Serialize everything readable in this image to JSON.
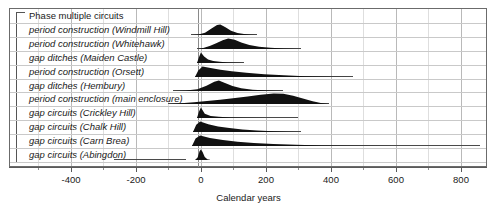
{
  "chart_data": {
    "type": "area",
    "title": "",
    "xlabel": "Calendar years",
    "ylabel": "",
    "xlim": [
      -520,
      900
    ],
    "grid": true,
    "legend_position": "none",
    "group_label": "Phase multiple circuits",
    "categories": [
      "period construction  (Windmill Hill)",
      "period construction  (Whitehawk)",
      "gap ditches  (Maiden Castle)",
      "period construction  (Orsett)",
      "gap ditches  (Hembury)",
      "period construction  (main enclosure)",
      "gap circuits  (Crickley Hill)",
      "gap circuits  (Chalk Hill)",
      "gap circuits  (Carn Brea)",
      "gap circuits  (Abingdon)"
    ],
    "tick_values": [
      -400,
      -200,
      0,
      200,
      400,
      600,
      800
    ],
    "tick_labels": [
      "-400",
      "-200",
      "0",
      "200",
      "400",
      "600",
      "800"
    ],
    "minor_tick_values": [
      -500,
      -300,
      -100,
      100,
      300,
      500,
      700
    ],
    "series": [
      {
        "name": "period construction  (Windmill Hill)",
        "range_start": -30,
        "range_end": 175,
        "mode": 60,
        "peak_height": 1.0,
        "points": [
          [
            -25,
            0.0
          ],
          [
            -5,
            0.05
          ],
          [
            15,
            0.22
          ],
          [
            35,
            0.62
          ],
          [
            52,
            0.95
          ],
          [
            62,
            1.0
          ],
          [
            78,
            0.74
          ],
          [
            95,
            0.42
          ],
          [
            115,
            0.2
          ],
          [
            135,
            0.09
          ],
          [
            155,
            0.03
          ],
          [
            175,
            0.0
          ]
        ]
      },
      {
        "name": "period construction  (Whitehawk)",
        "range_start": -10,
        "range_end": 310,
        "mode": 85,
        "peak_height": 1.0,
        "points": [
          [
            -8,
            0.0
          ],
          [
            8,
            0.1
          ],
          [
            28,
            0.3
          ],
          [
            48,
            0.55
          ],
          [
            68,
            0.85
          ],
          [
            85,
            1.0
          ],
          [
            105,
            0.88
          ],
          [
            125,
            0.62
          ],
          [
            150,
            0.38
          ],
          [
            180,
            0.22
          ],
          [
            215,
            0.12
          ],
          [
            255,
            0.05
          ],
          [
            310,
            0.0
          ]
        ]
      },
      {
        "name": "gap ditches  (Maiden Castle)",
        "range_start": -12,
        "range_end": 135,
        "mode": 0,
        "peak_height": 1.0,
        "points": [
          [
            -12,
            0.0
          ],
          [
            -6,
            0.55
          ],
          [
            0,
            1.0
          ],
          [
            10,
            0.62
          ],
          [
            22,
            0.34
          ],
          [
            38,
            0.2
          ],
          [
            58,
            0.11
          ],
          [
            82,
            0.05
          ],
          [
            108,
            0.02
          ],
          [
            135,
            0.0
          ]
        ]
      },
      {
        "name": "period construction  (Orsett)",
        "range_start": -18,
        "range_end": 470,
        "mode": 5,
        "peak_height": 1.0,
        "points": [
          [
            -18,
            0.0
          ],
          [
            -8,
            0.62
          ],
          [
            5,
            1.0
          ],
          [
            30,
            0.86
          ],
          [
            60,
            0.7
          ],
          [
            95,
            0.55
          ],
          [
            140,
            0.4
          ],
          [
            195,
            0.27
          ],
          [
            255,
            0.16
          ],
          [
            320,
            0.08
          ],
          [
            395,
            0.03
          ],
          [
            470,
            0.0
          ]
        ]
      },
      {
        "name": "gap ditches  (Hembury)",
        "range_start": -85,
        "range_end": 255,
        "mode": 55,
        "peak_height": 1.0,
        "points": [
          [
            -85,
            0.0
          ],
          [
            -45,
            0.04
          ],
          [
            -10,
            0.18
          ],
          [
            18,
            0.5
          ],
          [
            42,
            0.88
          ],
          [
            56,
            1.0
          ],
          [
            75,
            0.78
          ],
          [
            98,
            0.48
          ],
          [
            125,
            0.26
          ],
          [
            160,
            0.12
          ],
          [
            205,
            0.04
          ],
          [
            255,
            0.0
          ]
        ]
      },
      {
        "name": "period construction  (main enclosure)",
        "range_start": -100,
        "range_end": 395,
        "mode": 240,
        "peak_height": 1.0,
        "points": [
          [
            -100,
            0.0
          ],
          [
            -60,
            0.08
          ],
          [
            -20,
            0.18
          ],
          [
            20,
            0.3
          ],
          [
            60,
            0.42
          ],
          [
            100,
            0.56
          ],
          [
            145,
            0.72
          ],
          [
            185,
            0.88
          ],
          [
            225,
            1.0
          ],
          [
            255,
            0.98
          ],
          [
            285,
            0.8
          ],
          [
            315,
            0.52
          ],
          [
            345,
            0.26
          ],
          [
            370,
            0.1
          ],
          [
            395,
            0.0
          ]
        ]
      },
      {
        "name": "gap circuits  (Crickley Hill)",
        "range_start": -12,
        "range_end": 300,
        "mode": 0,
        "peak_height": 1.0,
        "points": [
          [
            -12,
            0.0
          ],
          [
            -6,
            0.6
          ],
          [
            0,
            1.0
          ],
          [
            12,
            0.42
          ],
          [
            30,
            0.2
          ],
          [
            55,
            0.11
          ],
          [
            90,
            0.06
          ],
          [
            140,
            0.03
          ],
          [
            200,
            0.01
          ],
          [
            300,
            0.0
          ]
        ]
      },
      {
        "name": "gap circuits  (Chalk Hill)",
        "range_start": -22,
        "range_end": 310,
        "mode": 0,
        "peak_height": 1.0,
        "points": [
          [
            -22,
            0.0
          ],
          [
            -12,
            0.7
          ],
          [
            0,
            1.0
          ],
          [
            25,
            0.74
          ],
          [
            55,
            0.54
          ],
          [
            90,
            0.38
          ],
          [
            130,
            0.25
          ],
          [
            175,
            0.15
          ],
          [
            225,
            0.08
          ],
          [
            270,
            0.03
          ],
          [
            310,
            0.0
          ]
        ]
      },
      {
        "name": "gap circuits  (Carn Brea)",
        "range_start": -25,
        "range_end": 860,
        "mode": 0,
        "peak_height": 1.0,
        "points": [
          [
            -25,
            0.0
          ],
          [
            -14,
            0.72
          ],
          [
            0,
            1.0
          ],
          [
            30,
            0.78
          ],
          [
            70,
            0.58
          ],
          [
            115,
            0.42
          ],
          [
            165,
            0.3
          ],
          [
            225,
            0.2
          ],
          [
            295,
            0.12
          ],
          [
            375,
            0.06
          ],
          [
            470,
            0.03
          ],
          [
            600,
            0.01
          ],
          [
            860,
            0.0
          ]
        ]
      },
      {
        "name": "gap circuits  (Abingdon)",
        "range_start": -265,
        "range_end": -45,
        "mode": 0,
        "peak_height": 1.0,
        "points": [
          [
            -18,
            0.0
          ],
          [
            -10,
            0.25
          ],
          [
            -4,
            0.85
          ],
          [
            0,
            1.0
          ],
          [
            5,
            0.8
          ],
          [
            12,
            0.3
          ],
          [
            20,
            0.08
          ],
          [
            30,
            0.0
          ]
        ]
      }
    ]
  }
}
